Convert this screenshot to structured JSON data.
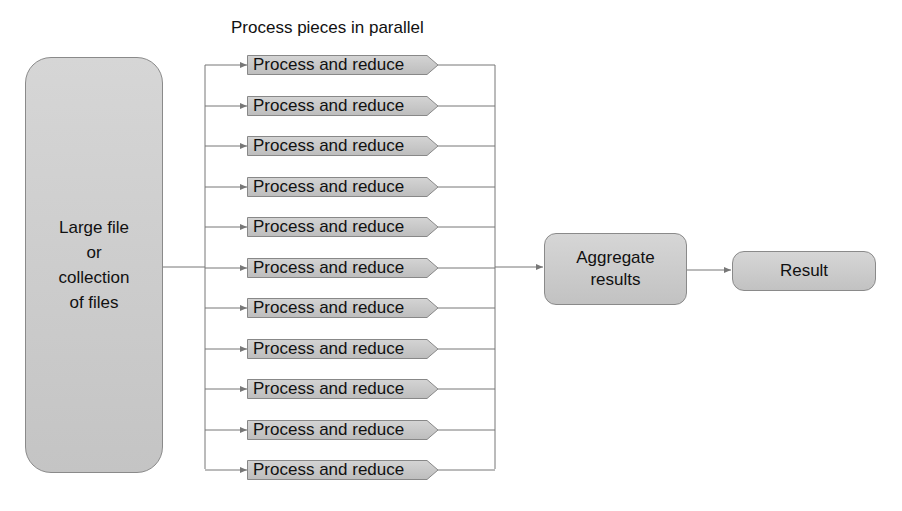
{
  "diagram": {
    "title": "Process pieces in parallel",
    "source": {
      "lines": [
        "Large file",
        "or",
        "collection",
        "of files"
      ]
    },
    "workers": [
      {
        "label": "Process and reduce"
      },
      {
        "label": "Process and reduce"
      },
      {
        "label": "Process and reduce"
      },
      {
        "label": "Process and reduce"
      },
      {
        "label": "Process and reduce"
      },
      {
        "label": "Process and reduce"
      },
      {
        "label": "Process and reduce"
      },
      {
        "label": "Process and reduce"
      },
      {
        "label": "Process and reduce"
      },
      {
        "label": "Process and reduce"
      },
      {
        "label": "Process and reduce"
      }
    ],
    "aggregate": {
      "lines": [
        "Aggregate",
        "results"
      ]
    },
    "result": {
      "label": "Result"
    },
    "colors": {
      "box_fill": "#cccccc",
      "border": "#8a8a8a",
      "line": "#777777"
    }
  }
}
